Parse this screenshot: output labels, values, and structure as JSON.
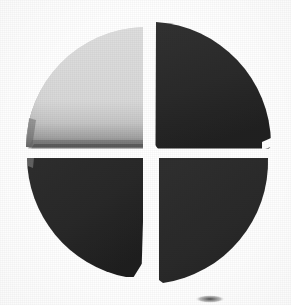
{
  "document": {
    "kind": "logo-mark",
    "background_color": "#ffffff",
    "width": 291,
    "height": 305,
    "alt_text": "Four-quadrant segmented circle mark"
  },
  "chart_data": {
    "type": "pie",
    "title": "",
    "subtitle": "",
    "xlabel": "",
    "ylabel": "",
    "legend": false,
    "legend_position": "none",
    "grid": false,
    "labels_shown": false,
    "categories": [
      "top-left",
      "top-right",
      "bottom-right",
      "bottom-left"
    ],
    "values": [
      25,
      25,
      25,
      25
    ],
    "value_unit": "percent",
    "total": 100,
    "start_angle_deg": 0,
    "slice_gap_px": 7,
    "center": {
      "x": 147,
      "y": 152
    },
    "radius": 123,
    "slices": [
      {
        "name": "top-left",
        "value": 25,
        "percent": "25%",
        "fill": "#dcdcdc",
        "edge_shadow": "#5a5a5a",
        "start_deg": 180,
        "end_deg": 270
      },
      {
        "name": "top-right",
        "value": 25,
        "percent": "25%",
        "fill": "#2b2b2b",
        "edge_shadow": "#151515",
        "start_deg": 270,
        "end_deg": 360
      },
      {
        "name": "bottom-right",
        "value": 25,
        "percent": "25%",
        "fill": "#2c2c2c",
        "edge_shadow": "#151515",
        "start_deg": 0,
        "end_deg": 90
      },
      {
        "name": "bottom-left",
        "value": 25,
        "percent": "25%",
        "fill": "#2a2a2a",
        "edge_shadow": "#151515",
        "start_deg": 90,
        "end_deg": 180
      }
    ],
    "colors": {
      "light_slice": "#dcdcdc",
      "dark_slice": "#2b2b2b",
      "background": "#ffffff",
      "shadow": "#4f4f4f"
    }
  },
  "artifacts": {
    "bottom_mark": {
      "name": "partial-ellipse-artifact",
      "description": "faint clipped dark ellipse at lower edge",
      "color": "#3a3a3a",
      "x": 210,
      "y": 299,
      "width": 30,
      "height": 8
    }
  }
}
